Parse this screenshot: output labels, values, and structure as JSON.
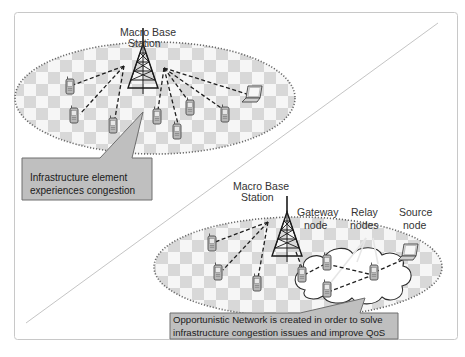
{
  "diagram": {
    "colors": {
      "frame_border": "#c8c8c8",
      "diagonal": "#b8b8b8",
      "ellipse_border": "#707070",
      "checker_dark": "#d9d9d9",
      "checker_light": "#f5f5f5",
      "callout_fill": "#bfbfbf",
      "callout_border": "#6e6e6e",
      "link_dash": "#222222",
      "relay_link": "#e8e8e8",
      "cloud_fill": "#ffffff"
    },
    "top_scene": {
      "tower_label_line1": "Macro Base",
      "tower_label_line2": "Station",
      "callout_line1": "Infrastructure element",
      "callout_line2": "experiences congestion",
      "devices": [
        "phone",
        "phone",
        "phone",
        "phone",
        "phone",
        "phone",
        "phone",
        "laptop"
      ]
    },
    "bottom_scene": {
      "tower_label_line1": "Macro Base",
      "tower_label_line2": "Station",
      "gateway_label_line1": "Gateway",
      "gateway_label_line2": "node",
      "relay_label_line1": "Relay",
      "relay_label_line2": "nodes",
      "source_label_line1": "Source",
      "source_label_line2": "node",
      "callout_line1": "Opportunistic Network is created in order to solve",
      "callout_line2": "infrastructure congestion issues and improve QoS",
      "devices": [
        "phone",
        "phone",
        "phone",
        "phone",
        "phone",
        "phone",
        "phone",
        "laptop"
      ]
    }
  }
}
